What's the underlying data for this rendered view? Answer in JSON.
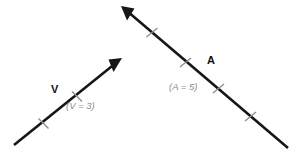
{
  "figure": {
    "background_color": "#ffffff",
    "line_color": "#161616",
    "tick_color": "#8f8f8f",
    "label_color": "#111111",
    "magnitude_color": "#8a8a8a"
  },
  "vectors": [
    {
      "id": "vector-v",
      "label": "V",
      "magnitude_text": "(V = 3)",
      "magnitude_value": 3,
      "symbol": "V",
      "tick_count": 2,
      "direction": "up-right",
      "start": {
        "x": 14,
        "y": 145
      },
      "tip": {
        "x": 122,
        "y": 58
      }
    },
    {
      "id": "vector-a",
      "label": "A",
      "magnitude_text": "(A = 5)",
      "magnitude_value": 5,
      "symbol": "A",
      "tick_count": 4,
      "direction": "up-left",
      "start": {
        "x": 288,
        "y": 148
      },
      "tip": {
        "x": 121,
        "y": 6
      }
    }
  ]
}
